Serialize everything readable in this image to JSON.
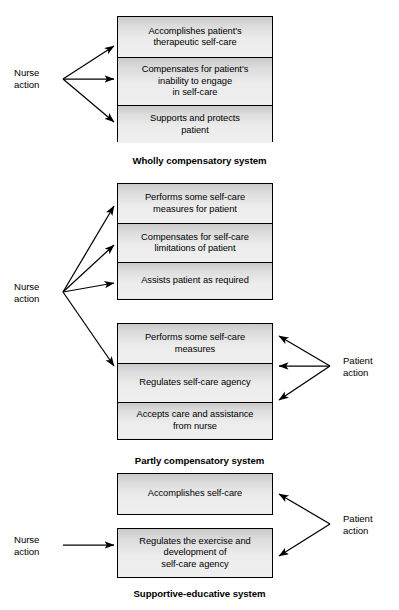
{
  "figure": {
    "title_absent": true,
    "background_color": "#ffffff",
    "box_border_color": "#000000",
    "box_fill_top": "#c9c9c9",
    "box_fill_bottom": "#efefef",
    "arrow_color": "#000000"
  },
  "sections": [
    {
      "id": "wholly-compensatory",
      "caption": "Wholly compensatory system",
      "nurse_label": {
        "line1": "Nurse",
        "line2": "action"
      },
      "patient_label": null,
      "groups": [
        {
          "id": "wholly-group",
          "cells": [
            {
              "lines": [
                "Accomplishes patient's",
                "therapeutic self-care"
              ]
            },
            {
              "lines": [
                "Compensates for patient's",
                "inability to engage",
                "in self-care"
              ]
            },
            {
              "lines": [
                "Supports and protects",
                "patient"
              ]
            }
          ]
        }
      ]
    },
    {
      "id": "partly-compensatory",
      "caption": "Partly compensatory system",
      "nurse_label": {
        "line1": "Nurse",
        "line2": "action"
      },
      "patient_label": {
        "line1": "Patient",
        "line2": "action"
      },
      "groups": [
        {
          "id": "partly-group-nurse",
          "cells": [
            {
              "lines": [
                "Performs some self-care",
                "measures for patient"
              ]
            },
            {
              "lines": [
                "Compensates for self-care",
                "limitations of patient"
              ]
            },
            {
              "lines": [
                "Assists patient as required"
              ]
            }
          ]
        },
        {
          "id": "partly-group-patient",
          "cells": [
            {
              "lines": [
                "Performs some self-care",
                "measures"
              ]
            },
            {
              "lines": [
                "Regulates self-care agency"
              ]
            },
            {
              "lines": [
                "Accepts care and assistance",
                "from nurse"
              ]
            }
          ]
        }
      ]
    },
    {
      "id": "supportive-educative",
      "caption": "Supportive-educative system",
      "nurse_label": {
        "line1": "Nurse",
        "line2": "action"
      },
      "patient_label": {
        "line1": "Patient",
        "line2": "action"
      },
      "groups": [
        {
          "id": "supportive-group-a",
          "cells": [
            {
              "lines": [
                "Accomplishes self-care"
              ]
            }
          ]
        },
        {
          "id": "supportive-group-b",
          "cells": [
            {
              "lines": [
                "Regulates the exercise and",
                "development of",
                "self-care agency"
              ]
            }
          ]
        }
      ]
    }
  ]
}
